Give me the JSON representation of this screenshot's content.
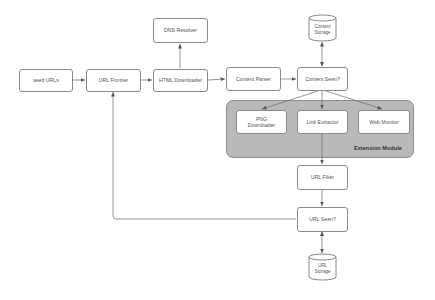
{
  "diagram": {
    "nodes": {
      "seed_urls": "seed URLs",
      "url_frontier": "URL Frontier",
      "html_downloader": "HTML Downloader",
      "dns_resolver": "DNS Resolver",
      "content_parser": "Content Parser",
      "content_seen": "Content Seen?",
      "content_storage_line1": "Content",
      "content_storage_line2": "Storage",
      "png_downloader_line1": "PNG",
      "png_downloader_line2": "Downloader",
      "link_extractor": "Link Extractor",
      "web_monitor": "Web Monitor",
      "url_filter": "URL Filter",
      "url_seen": "URL Seen?",
      "url_storage_line1": "URL",
      "url_storage_line2": "Storage"
    },
    "group": {
      "extension_module": "Extension Module"
    },
    "colors": {
      "node_border": "#8a8a8a",
      "group_fill": "#b9b9b9",
      "edge": "#666666"
    },
    "edges": [
      {
        "from": "seed URLs",
        "to": "URL Frontier"
      },
      {
        "from": "URL Frontier",
        "to": "HTML Downloader"
      },
      {
        "from": "HTML Downloader",
        "to": "DNS Resolver"
      },
      {
        "from": "HTML Downloader",
        "to": "Content Parser"
      },
      {
        "from": "Content Parser",
        "to": "Content Seen?"
      },
      {
        "from": "Content Seen?",
        "to": "Content Storage",
        "bidirectional": true
      },
      {
        "from": "Content Seen?",
        "to": "PNG Downloader"
      },
      {
        "from": "Content Seen?",
        "to": "Link Extractor"
      },
      {
        "from": "Content Seen?",
        "to": "Web Monitor"
      },
      {
        "from": "Link Extractor",
        "to": "URL Filter"
      },
      {
        "from": "URL Filter",
        "to": "URL Seen?"
      },
      {
        "from": "URL Seen?",
        "to": "URL Storage",
        "bidirectional": true
      },
      {
        "from": "URL Seen?",
        "to": "URL Frontier"
      }
    ]
  }
}
